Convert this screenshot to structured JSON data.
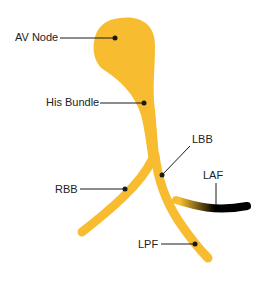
{
  "diagram": {
    "colors": {
      "conduction": "#F7BC2F",
      "blocked": "#000000",
      "leader": "#1a1a1a",
      "text": "#222222"
    },
    "labels": {
      "av_node": "AV Node",
      "his_bundle": "His Bundle",
      "lbb": "LBB",
      "rbb": "RBB",
      "laf": "LAF",
      "lpf": "LPF"
    }
  }
}
